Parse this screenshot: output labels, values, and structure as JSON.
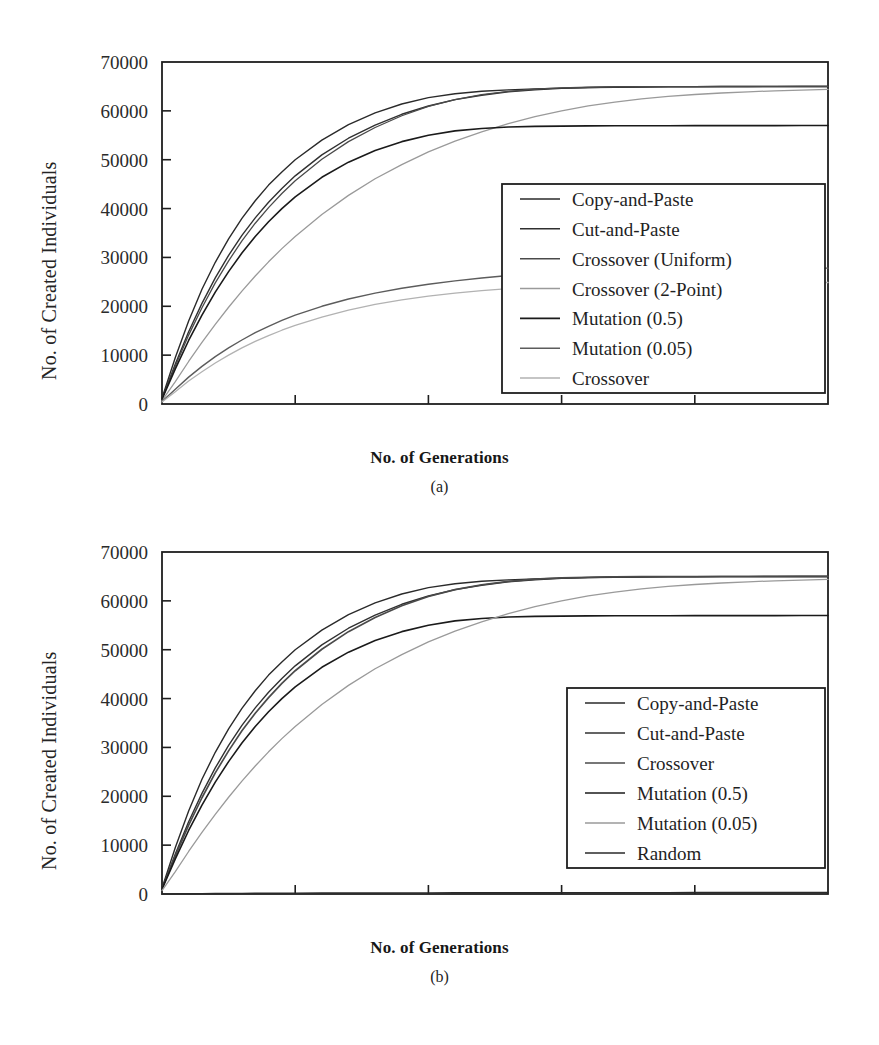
{
  "figures": [
    {
      "id": "a",
      "caption": "(a)",
      "xlabel": "No. of Generations",
      "ylabel": "No. of Created Individuals"
    },
    {
      "id": "b",
      "caption": "(b)",
      "xlabel": "No. of Generations",
      "ylabel": "No. of Created Individuals"
    }
  ],
  "chart_data": [
    {
      "type": "line",
      "panel": "(a)",
      "title": "",
      "xlabel": "No. of Generations",
      "ylabel": "No. of Created Individuals",
      "xlim": [
        0,
        5000
      ],
      "ylim": [
        0,
        70000
      ],
      "xticks": [
        0,
        1000,
        2000,
        3000,
        4000,
        5000
      ],
      "yticks": [
        0,
        10000,
        20000,
        30000,
        40000,
        50000,
        60000,
        70000
      ],
      "xtick_labels": [
        "0",
        "1000",
        "2000",
        "3000",
        "4000",
        "5000"
      ],
      "ytick_labels": [
        "0",
        "10000",
        "20000",
        "30000",
        "40000",
        "50000",
        "60000",
        "70000"
      ],
      "grid": false,
      "legend_position": "center-right",
      "legend_entries": [
        "Copy-and-Paste",
        "Cut-and-Paste",
        "Crossover (Uniform)",
        "Crossover (2-Point)",
        "Mutation (0.5)",
        "Mutation (0.05)",
        "Crossover"
      ],
      "x": [
        0,
        100,
        200,
        300,
        400,
        500,
        600,
        700,
        800,
        900,
        1000,
        1200,
        1400,
        1600,
        1800,
        2000,
        2200,
        2400,
        2600,
        2800,
        3000,
        3200,
        3400,
        3600,
        3800,
        4000,
        4200,
        4400,
        4600,
        4800,
        5000
      ],
      "series": [
        {
          "name": "Copy-and-Paste",
          "color": "#2a2a2a",
          "width": 1.4,
          "values": [
            1200,
            9500,
            17000,
            23500,
            29000,
            33800,
            38000,
            41600,
            44800,
            47500,
            50000,
            54000,
            57200,
            59600,
            61400,
            62700,
            63500,
            64000,
            64300,
            64500,
            64650,
            64750,
            64820,
            64870,
            64900,
            64930,
            64950,
            64960,
            64970,
            64980,
            64990
          ]
        },
        {
          "name": "Cut-and-Paste",
          "color": "#303030",
          "width": 1.4,
          "values": [
            1100,
            8200,
            14800,
            20600,
            25800,
            30400,
            34500,
            38100,
            41300,
            44100,
            46700,
            51000,
            54400,
            57100,
            59300,
            61000,
            62300,
            63200,
            63900,
            64300,
            64600,
            64780,
            64870,
            64920,
            64950,
            64970,
            64980,
            64985,
            64990,
            64995,
            65000
          ]
        },
        {
          "name": "Crossover (Uniform)",
          "color": "#4a4a4a",
          "width": 1.3,
          "values": [
            1050,
            7800,
            14100,
            19700,
            24800,
            29300,
            33400,
            37000,
            40200,
            43100,
            45700,
            50100,
            53700,
            56600,
            59000,
            60900,
            62300,
            63300,
            64000,
            64450,
            64700,
            64830,
            64900,
            64940,
            64960,
            64975,
            64985,
            64990,
            64995,
            64998,
            65000
          ]
        },
        {
          "name": "Crossover (2-Point)",
          "color": "#9a9a9a",
          "width": 1.3,
          "values": [
            700,
            4600,
            8700,
            12600,
            16300,
            19800,
            23100,
            26200,
            29100,
            31800,
            34300,
            38800,
            42700,
            46100,
            49000,
            51600,
            53800,
            55700,
            57400,
            58800,
            60000,
            61000,
            61800,
            62450,
            62950,
            63350,
            63650,
            63900,
            64100,
            64250,
            64400
          ]
        },
        {
          "name": "Mutation (0.5)",
          "color": "#1a1a1a",
          "width": 1.6,
          "values": [
            1000,
            7200,
            13000,
            18200,
            22900,
            27100,
            30900,
            34300,
            37300,
            40000,
            42400,
            46400,
            49500,
            51900,
            53700,
            55000,
            55900,
            56400,
            56700,
            56820,
            56880,
            56920,
            56940,
            56955,
            56965,
            56970,
            56975,
            56980,
            56985,
            56990,
            56995
          ]
        },
        {
          "name": "Mutation (0.05)",
          "color": "#5c5c5c",
          "width": 1.4,
          "values": [
            500,
            3000,
            5500,
            7700,
            9700,
            11500,
            13100,
            14600,
            15900,
            17100,
            18200,
            20000,
            21500,
            22700,
            23700,
            24500,
            25200,
            25800,
            26300,
            26700,
            27100,
            27400,
            27550,
            27650,
            27700,
            27740,
            27760,
            27780,
            27790,
            27800,
            27810
          ]
        },
        {
          "name": "Crossover",
          "color": "#b2b2b2",
          "width": 1.3,
          "values": [
            400,
            2500,
            4700,
            6600,
            8400,
            10000,
            11500,
            12800,
            14000,
            15100,
            16100,
            17800,
            19200,
            20400,
            21300,
            22100,
            22700,
            23200,
            23600,
            23900,
            24150,
            24350,
            24500,
            24600,
            24680,
            24740,
            24780,
            24810,
            24830,
            24850,
            24870
          ]
        }
      ]
    },
    {
      "type": "line",
      "panel": "(b)",
      "title": "",
      "xlabel": "No. of Generations",
      "ylabel": "No. of Created Individuals",
      "xlim": [
        0,
        5000
      ],
      "ylim": [
        0,
        70000
      ],
      "xticks": [
        0,
        1000,
        2000,
        3000,
        4000,
        5000
      ],
      "yticks": [
        0,
        10000,
        20000,
        30000,
        40000,
        50000,
        60000,
        70000
      ],
      "xtick_labels": [
        "0",
        "1000",
        "2000",
        "3000",
        "4000",
        "5000"
      ],
      "ytick_labels": [
        "0",
        "10000",
        "20000",
        "30000",
        "40000",
        "50000",
        "60000",
        "70000"
      ],
      "grid": false,
      "legend_position": "center-right",
      "legend_entries": [
        "Copy-and-Paste",
        "Cut-and-Paste",
        "Crossover",
        "Mutation (0.5)",
        "Mutation (0.05)",
        "Random"
      ],
      "x": [
        0,
        100,
        200,
        300,
        400,
        500,
        600,
        700,
        800,
        900,
        1000,
        1200,
        1400,
        1600,
        1800,
        2000,
        2200,
        2400,
        2600,
        2800,
        3000,
        3200,
        3400,
        3600,
        3800,
        4000,
        4200,
        4400,
        4600,
        4800,
        5000
      ],
      "series": [
        {
          "name": "Copy-and-Paste",
          "color": "#2a2a2a",
          "width": 1.4,
          "values": [
            1200,
            9500,
            17000,
            23500,
            29000,
            33800,
            38000,
            41600,
            44800,
            47500,
            50000,
            54000,
            57200,
            59600,
            61400,
            62700,
            63500,
            64000,
            64300,
            64500,
            64650,
            64750,
            64820,
            64870,
            64900,
            64930,
            64950,
            64960,
            64970,
            64980,
            64990
          ]
        },
        {
          "name": "Cut-and-Paste",
          "color": "#303030",
          "width": 1.4,
          "values": [
            1100,
            8200,
            14800,
            20600,
            25800,
            30400,
            34500,
            38100,
            41300,
            44100,
            46700,
            51000,
            54400,
            57100,
            59300,
            61000,
            62300,
            63200,
            63900,
            64300,
            64600,
            64780,
            64870,
            64920,
            64950,
            64970,
            64980,
            64985,
            64990,
            64995,
            65000
          ]
        },
        {
          "name": "Crossover",
          "color": "#4a4a4a",
          "width": 1.7,
          "values": [
            1050,
            7800,
            14100,
            19700,
            24800,
            29300,
            33400,
            37000,
            40200,
            43100,
            45700,
            50100,
            53700,
            56600,
            59000,
            60900,
            62300,
            63300,
            64000,
            64450,
            64700,
            64830,
            64900,
            64940,
            64960,
            64975,
            64985,
            64990,
            64995,
            64998,
            65000
          ]
        },
        {
          "name": "Mutation (0.5)",
          "color": "#1a1a1a",
          "width": 1.6,
          "values": [
            1000,
            7200,
            13000,
            18200,
            22900,
            27100,
            30900,
            34300,
            37300,
            40000,
            42400,
            46400,
            49500,
            51900,
            53700,
            55000,
            55900,
            56400,
            56700,
            56820,
            56880,
            56920,
            56940,
            56955,
            56965,
            56970,
            56975,
            56980,
            56985,
            56990,
            56995
          ]
        },
        {
          "name": "Mutation (0.05)",
          "color": "#9a9a9a",
          "width": 1.3,
          "values": [
            700,
            4600,
            8700,
            12600,
            16300,
            19800,
            23100,
            26200,
            29100,
            31800,
            34300,
            38800,
            42700,
            46100,
            49000,
            51600,
            53800,
            55700,
            57400,
            58800,
            60000,
            61000,
            61800,
            62450,
            62950,
            63350,
            63650,
            63900,
            64100,
            64250,
            64400
          ]
        },
        {
          "name": "Random",
          "color": "#2a2a2a",
          "width": 1.4,
          "values": [
            0,
            30,
            55,
            75,
            95,
            110,
            125,
            140,
            150,
            160,
            170,
            190,
            205,
            220,
            230,
            240,
            250,
            258,
            265,
            270,
            275,
            280,
            284,
            288,
            291,
            294,
            296,
            298,
            300,
            302,
            304
          ]
        }
      ]
    }
  ]
}
